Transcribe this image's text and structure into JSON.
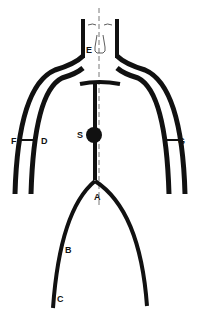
{
  "diagram": {
    "type": "anatomical-schematic",
    "colors": {
      "stroke": "#111111",
      "background": "#ffffff",
      "midline": "#555555"
    },
    "labels": {
      "A": "A",
      "B": "B",
      "C": "C",
      "D": "D",
      "E": "E",
      "F": "F",
      "G": "G",
      "S": "S"
    }
  }
}
